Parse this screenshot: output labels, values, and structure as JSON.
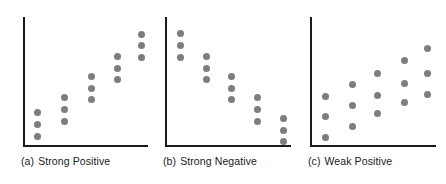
{
  "figure": {
    "background_color": "#ffffff",
    "axis_color": "#1a1a1a",
    "dot_color": "#7d7d7d",
    "caption_color": "#1a1a1a"
  },
  "panels": [
    {
      "id": "a",
      "tag": "(a)",
      "caption": "Strong Positive",
      "caption_full": "(a)  Strong Positive",
      "axis": {
        "left": 23,
        "top": 17,
        "bottom": 145,
        "right": 148
      },
      "caption_pos": {
        "left": 21,
        "top": 155
      }
    },
    {
      "id": "b",
      "tag": "(b)",
      "caption": "Strong Negative",
      "caption_full": "(b)  Strong Negative",
      "axis": {
        "left": 165,
        "top": 17,
        "bottom": 145,
        "right": 291
      },
      "caption_pos": {
        "left": 163,
        "top": 155
      }
    },
    {
      "id": "c",
      "tag": "(c)",
      "caption": "Weak Positive",
      "caption_full": "(c)  Weak Positive",
      "axis": {
        "left": 310,
        "top": 17,
        "bottom": 145,
        "right": 436
      },
      "caption_pos": {
        "left": 308,
        "top": 155
      }
    }
  ],
  "chart_data": [
    {
      "type": "scatter",
      "title": "(a) Strong Positive",
      "xlabel": "",
      "ylabel": "",
      "grid": false,
      "legend": "none",
      "xlim": [
        0,
        6
      ],
      "ylim": [
        0,
        6
      ],
      "relationship": "strong positive",
      "n_points": 15,
      "columns": 5,
      "points_per_column": 3,
      "points": [
        {
          "x": 1,
          "y": 1.7
        },
        {
          "x": 1,
          "y": 1.3
        },
        {
          "x": 1,
          "y": 0.9
        },
        {
          "x": 2,
          "y": 2.5
        },
        {
          "x": 2,
          "y": 2.1
        },
        {
          "x": 2,
          "y": 1.7
        },
        {
          "x": 3,
          "y": 3.4
        },
        {
          "x": 3,
          "y": 3.0
        },
        {
          "x": 3,
          "y": 2.6
        },
        {
          "x": 4,
          "y": 4.2
        },
        {
          "x": 4,
          "y": 3.8
        },
        {
          "x": 4,
          "y": 3.4
        },
        {
          "x": 5,
          "y": 5.0
        },
        {
          "x": 5,
          "y": 4.6
        },
        {
          "x": 5,
          "y": 4.2
        }
      ],
      "pixel_points": [
        {
          "x": 37,
          "y": 112
        },
        {
          "x": 37,
          "y": 124
        },
        {
          "x": 37,
          "y": 136
        },
        {
          "x": 64,
          "y": 97
        },
        {
          "x": 64,
          "y": 109
        },
        {
          "x": 64,
          "y": 121
        },
        {
          "x": 91,
          "y": 76
        },
        {
          "x": 91,
          "y": 88
        },
        {
          "x": 91,
          "y": 99
        },
        {
          "x": 117,
          "y": 56
        },
        {
          "x": 117,
          "y": 68
        },
        {
          "x": 117,
          "y": 79
        },
        {
          "x": 141,
          "y": 34
        },
        {
          "x": 141,
          "y": 45
        },
        {
          "x": 141,
          "y": 57
        }
      ]
    },
    {
      "type": "scatter",
      "title": "(b) Strong Negative",
      "xlabel": "",
      "ylabel": "",
      "grid": false,
      "legend": "none",
      "xlim": [
        0,
        6
      ],
      "ylim": [
        0,
        6
      ],
      "relationship": "strong negative",
      "n_points": 15,
      "columns": 5,
      "points_per_column": 3,
      "points": [
        {
          "x": 1,
          "y": 5.0
        },
        {
          "x": 1,
          "y": 4.6
        },
        {
          "x": 1,
          "y": 4.2
        },
        {
          "x": 2,
          "y": 4.2
        },
        {
          "x": 2,
          "y": 3.8
        },
        {
          "x": 2,
          "y": 3.4
        },
        {
          "x": 3,
          "y": 3.3
        },
        {
          "x": 3,
          "y": 2.9
        },
        {
          "x": 3,
          "y": 2.5
        },
        {
          "x": 4,
          "y": 2.4
        },
        {
          "x": 4,
          "y": 2.0
        },
        {
          "x": 4,
          "y": 1.6
        },
        {
          "x": 5,
          "y": 1.5
        },
        {
          "x": 5,
          "y": 1.1
        },
        {
          "x": 5,
          "y": 0.7
        }
      ],
      "pixel_points": [
        {
          "x": 180,
          "y": 33
        },
        {
          "x": 180,
          "y": 45
        },
        {
          "x": 180,
          "y": 57
        },
        {
          "x": 206,
          "y": 56
        },
        {
          "x": 206,
          "y": 68
        },
        {
          "x": 206,
          "y": 79
        },
        {
          "x": 231,
          "y": 76
        },
        {
          "x": 231,
          "y": 88
        },
        {
          "x": 231,
          "y": 99
        },
        {
          "x": 257,
          "y": 97
        },
        {
          "x": 257,
          "y": 109
        },
        {
          "x": 257,
          "y": 121
        },
        {
          "x": 283,
          "y": 118
        },
        {
          "x": 283,
          "y": 130
        },
        {
          "x": 283,
          "y": 141
        }
      ]
    },
    {
      "type": "scatter",
      "title": "(c) Weak Positive",
      "xlabel": "",
      "ylabel": "",
      "grid": false,
      "legend": "none",
      "xlim": [
        0,
        6
      ],
      "ylim": [
        0,
        6
      ],
      "relationship": "weak positive",
      "n_points": 15,
      "columns": 5,
      "points_per_column": 3,
      "points": [
        {
          "x": 1,
          "y": 2.4
        },
        {
          "x": 1,
          "y": 1.8
        },
        {
          "x": 1,
          "y": 0.9
        },
        {
          "x": 2,
          "y": 2.9
        },
        {
          "x": 2,
          "y": 2.2
        },
        {
          "x": 2,
          "y": 1.3
        },
        {
          "x": 3,
          "y": 3.4
        },
        {
          "x": 3,
          "y": 2.4
        },
        {
          "x": 3,
          "y": 1.7
        },
        {
          "x": 4,
          "y": 4.0
        },
        {
          "x": 4,
          "y": 3.0
        },
        {
          "x": 4,
          "y": 2.2
        },
        {
          "x": 5,
          "y": 4.5
        },
        {
          "x": 5,
          "y": 3.4
        },
        {
          "x": 5,
          "y": 2.5
        }
      ],
      "pixel_points": [
        {
          "x": 325,
          "y": 96
        },
        {
          "x": 325,
          "y": 116
        },
        {
          "x": 325,
          "y": 137
        },
        {
          "x": 352,
          "y": 84
        },
        {
          "x": 352,
          "y": 105
        },
        {
          "x": 352,
          "y": 126
        },
        {
          "x": 377,
          "y": 73
        },
        {
          "x": 377,
          "y": 95
        },
        {
          "x": 377,
          "y": 113
        },
        {
          "x": 404,
          "y": 60
        },
        {
          "x": 404,
          "y": 83
        },
        {
          "x": 404,
          "y": 102
        },
        {
          "x": 427,
          "y": 48
        },
        {
          "x": 427,
          "y": 73
        },
        {
          "x": 427,
          "y": 94
        }
      ]
    }
  ]
}
